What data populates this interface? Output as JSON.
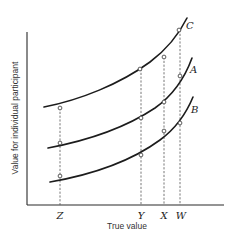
{
  "figure": {
    "x_axis_title": "True value",
    "y_axis_title": "Value for individual participant",
    "x_markers": [
      {
        "id": "Z",
        "label": "Z"
      },
      {
        "id": "Y",
        "label": "Y"
      },
      {
        "id": "X",
        "label": "X"
      },
      {
        "id": "W",
        "label": "W"
      }
    ],
    "curves": [
      {
        "id": "C",
        "label": "C",
        "position": "top"
      },
      {
        "id": "A",
        "label": "A",
        "position": "middle"
      },
      {
        "id": "B",
        "label": "B",
        "position": "bottom"
      }
    ],
    "points_marker": "open-circle"
  }
}
